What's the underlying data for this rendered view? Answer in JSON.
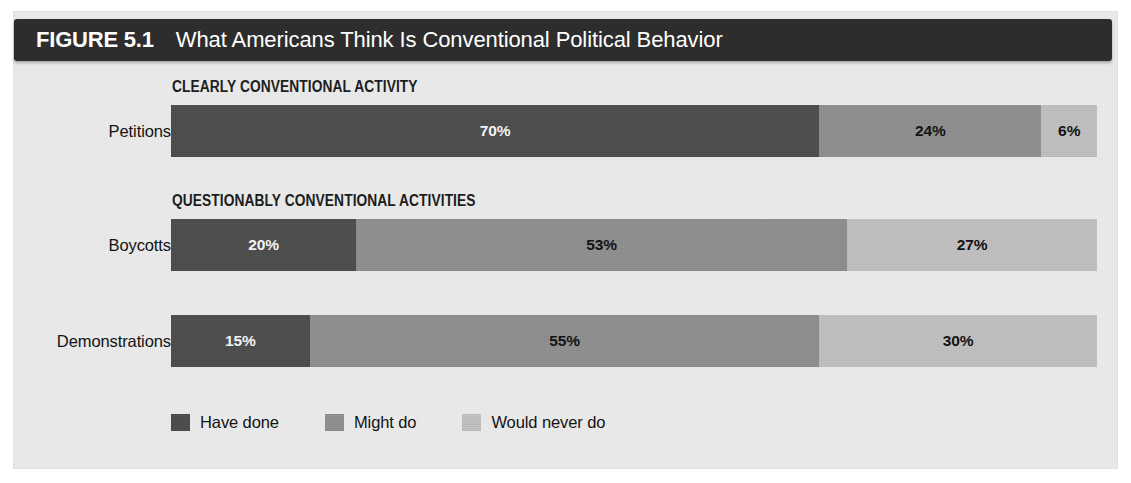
{
  "figure": {
    "number_label": "FIGURE 5.1",
    "title": "What Americans Think Is Conventional Political Behavior"
  },
  "colors": {
    "title_bar": "#2d2d2d",
    "panel_background": "#ebebeb",
    "have_done": "#4b4b4b",
    "might_do": "#8e8e8e",
    "would_never_do": "#c0c0c0"
  },
  "legend": {
    "items": [
      {
        "label": "Have done",
        "color": "#4b4b4b",
        "swatch_name": "legend-swatch-have-done"
      },
      {
        "label": "Might do",
        "color": "#8e8e8e",
        "swatch_name": "legend-swatch-might-do"
      },
      {
        "label": "Would never do",
        "color": "#c0c0c0",
        "swatch_name": "legend-swatch-would-never-do"
      }
    ]
  },
  "sections": [
    {
      "heading": "CLEARLY CONVENTIONAL ACTIVITY"
    },
    {
      "heading": "QUESTIONABLY CONVENTIONAL ACTIVITIES"
    }
  ],
  "rows": [
    {
      "label": "Petitions",
      "section": "CLEARLY CONVENTIONAL ACTIVITY",
      "segments": [
        {
          "series": "Have done",
          "value": 70,
          "text": "70%"
        },
        {
          "series": "Might do",
          "value": 24,
          "text": "24%"
        },
        {
          "series": "Would never do",
          "value": 6,
          "text": "6%"
        }
      ]
    },
    {
      "label": "Boycotts",
      "section": "QUESTIONABLY CONVENTIONAL ACTIVITIES",
      "segments": [
        {
          "series": "Have done",
          "value": 20,
          "text": "20%"
        },
        {
          "series": "Might do",
          "value": 53,
          "text": "53%"
        },
        {
          "series": "Would never do",
          "value": 27,
          "text": "27%"
        }
      ]
    },
    {
      "label": "Demonstrations",
      "section": "QUESTIONABLY CONVENTIONAL ACTIVITIES",
      "segments": [
        {
          "series": "Have done",
          "value": 15,
          "text": "15%"
        },
        {
          "series": "Might do",
          "value": 55,
          "text": "55%"
        },
        {
          "series": "Would never do",
          "value": 30,
          "text": "30%"
        }
      ]
    }
  ],
  "chart_data": {
    "type": "bar",
    "orientation": "horizontal",
    "stacked": true,
    "normalized_percent": true,
    "title": "What Americans Think Is Conventional Political Behavior",
    "figure_number": "FIGURE 5.1",
    "xlabel": "",
    "ylabel": "",
    "xlim": [
      0,
      100
    ],
    "grid": false,
    "legend_position": "bottom-left",
    "categories": [
      "Petitions",
      "Boycotts",
      "Demonstrations"
    ],
    "category_groups": [
      {
        "heading": "CLEARLY CONVENTIONAL ACTIVITY",
        "categories": [
          "Petitions"
        ]
      },
      {
        "heading": "QUESTIONABLY CONVENTIONAL ACTIVITIES",
        "categories": [
          "Boycotts",
          "Demonstrations"
        ]
      }
    ],
    "series": [
      {
        "name": "Have done",
        "color": "#4b4b4b",
        "values": [
          70,
          20,
          15
        ]
      },
      {
        "name": "Might do",
        "color": "#8e8e8e",
        "values": [
          24,
          53,
          55
        ]
      },
      {
        "name": "Would never do",
        "color": "#c0c0c0",
        "values": [
          6,
          27,
          30
        ]
      }
    ],
    "data_labels": [
      [
        "70%",
        "24%",
        "6%"
      ],
      [
        "20%",
        "53%",
        "27%"
      ],
      [
        "15%",
        "55%",
        "30%"
      ]
    ],
    "units": "percent"
  }
}
